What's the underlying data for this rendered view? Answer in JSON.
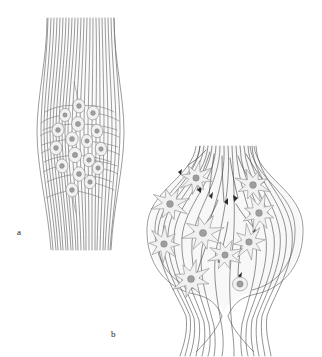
{
  "figure": {
    "type": "scientific-line-drawing",
    "background_color": "#ffffff",
    "panels": [
      {
        "id": "a",
        "label": "a",
        "label_x": 20,
        "label_y": 234,
        "description": "fusiform nerve bundle with longitudinal fibers and clustered oval cell bodies",
        "shape": "spindle",
        "bounds": {
          "x": 38,
          "y": 18,
          "w": 84,
          "h": 232
        },
        "fiber_count": 23,
        "cell_count": 17,
        "cell_shape": "oval",
        "cells": [
          {
            "cx": 79,
            "cy": 106,
            "rx": 6.0,
            "ry": 7.0,
            "rot": -8,
            "nr": 2.4
          },
          {
            "cx": 65,
            "cy": 115,
            "rx": 5.6,
            "ry": 6.6,
            "rot": 6,
            "nr": 2.2
          },
          {
            "cx": 93,
            "cy": 113,
            "rx": 6.0,
            "ry": 7.0,
            "rot": 10,
            "nr": 2.4
          },
          {
            "cx": 78,
            "cy": 124,
            "rx": 6.4,
            "ry": 7.4,
            "rot": -4,
            "nr": 2.6
          },
          {
            "cx": 58,
            "cy": 130,
            "rx": 6.0,
            "ry": 7.0,
            "rot": 12,
            "nr": 2.4
          },
          {
            "cx": 97,
            "cy": 131,
            "rx": 5.8,
            "ry": 6.8,
            "rot": -10,
            "nr": 2.3
          },
          {
            "cx": 72,
            "cy": 139,
            "rx": 6.2,
            "ry": 7.2,
            "rot": 3,
            "nr": 2.5
          },
          {
            "cx": 87,
            "cy": 141,
            "rx": 5.6,
            "ry": 6.6,
            "rot": -6,
            "nr": 2.2
          },
          {
            "cx": 56,
            "cy": 148,
            "rx": 6.0,
            "ry": 7.0,
            "rot": 8,
            "nr": 2.4
          },
          {
            "cx": 101,
            "cy": 149,
            "rx": 5.8,
            "ry": 6.8,
            "rot": -8,
            "nr": 2.3
          },
          {
            "cx": 75,
            "cy": 155,
            "rx": 6.6,
            "ry": 7.6,
            "rot": 0,
            "nr": 2.7
          },
          {
            "cx": 89,
            "cy": 160,
            "rx": 5.8,
            "ry": 6.8,
            "rot": 9,
            "nr": 2.3
          },
          {
            "cx": 62,
            "cy": 166,
            "rx": 6.0,
            "ry": 7.0,
            "rot": -5,
            "nr": 2.4
          },
          {
            "cx": 98,
            "cy": 168,
            "rx": 5.6,
            "ry": 6.6,
            "rot": 7,
            "nr": 2.2
          },
          {
            "cx": 79,
            "cy": 174,
            "rx": 6.2,
            "ry": 7.2,
            "rot": -3,
            "nr": 2.5
          },
          {
            "cx": 90,
            "cy": 182,
            "rx": 5.8,
            "ry": 6.8,
            "rot": 11,
            "nr": 2.3
          },
          {
            "cx": 72,
            "cy": 190,
            "rx": 6.0,
            "ry": 7.0,
            "rot": -9,
            "nr": 2.4
          }
        ]
      },
      {
        "id": "b",
        "label": "b",
        "label_x": 114,
        "label_y": 336,
        "description": "bifurcating nerve trunk forming a ganglionic swelling containing stellate cells with arrowhead fiber terminals",
        "shape": "bifurcation",
        "bounds": {
          "x": 146,
          "y": 146,
          "w": 156,
          "h": 206
        },
        "fiber_count": 18,
        "cell_count": 10,
        "cell_shape": "stellate",
        "cells": [
          {
            "cx": 196,
            "cy": 178,
            "r": 10.5,
            "spikes": 8,
            "nr": 3.2,
            "rot": 12
          },
          {
            "cx": 170,
            "cy": 204,
            "r": 11.5,
            "spikes": 8,
            "nr": 3.4,
            "rot": 30
          },
          {
            "cx": 203,
            "cy": 233,
            "r": 12.5,
            "spikes": 8,
            "nr": 3.6,
            "rot": -14
          },
          {
            "cx": 164,
            "cy": 244,
            "r": 11.0,
            "spikes": 8,
            "nr": 3.3,
            "rot": 48
          },
          {
            "cx": 253,
            "cy": 185,
            "r": 11.0,
            "spikes": 8,
            "nr": 3.4,
            "rot": -24
          },
          {
            "cx": 259,
            "cy": 213,
            "r": 11.5,
            "spikes": 8,
            "nr": 3.4,
            "rot": 18
          },
          {
            "cx": 249,
            "cy": 242,
            "r": 11.0,
            "spikes": 8,
            "nr": 3.3,
            "rot": -8
          },
          {
            "cx": 225,
            "cy": 255,
            "r": 10.5,
            "spikes": 8,
            "nr": 3.2,
            "rot": 26
          },
          {
            "cx": 191,
            "cy": 279,
            "r": 12.0,
            "spikes": 8,
            "nr": 3.5,
            "rot": -30
          },
          {
            "cx": 240,
            "cy": 284,
            "r": 7.5,
            "spikes": 0,
            "nr": 3.2,
            "rot": 0
          }
        ],
        "terminal_count": 12
      }
    ],
    "colors": {
      "outline": "#555555",
      "fiber": "#4a4a4a",
      "cell_fill": "#f1f1f1",
      "cell_outline": "#8a8a8a",
      "nucleus_fill": "#9e9e9e",
      "nucleus_outline": "#7a7a7a",
      "sheath_fill": "#f7f7f7",
      "terminal": "#2b2b2b",
      "label_text": "#1a1a1a"
    }
  }
}
